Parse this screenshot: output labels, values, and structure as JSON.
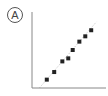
{
  "panel": {
    "label": "A"
  },
  "chart_data": {
    "type": "scatter",
    "title": "",
    "xlabel": "",
    "ylabel": "",
    "grid": false,
    "legend": null,
    "trendline": {
      "style": "dotted",
      "color": "#cccccc",
      "from": [
        0.1,
        0.0
      ],
      "to": [
        0.87,
        0.87
      ]
    },
    "xlim": [
      0,
      1
    ],
    "ylim": [
      0,
      1
    ],
    "x": [
      0.2,
      0.3,
      0.41,
      0.49,
      0.55,
      0.64,
      0.72,
      0.8
    ],
    "y": [
      0.11,
      0.21,
      0.35,
      0.39,
      0.5,
      0.61,
      0.68,
      0.76
    ],
    "marker": {
      "shape": "square",
      "color": "#222222",
      "size": 4
    },
    "axis_color": "#888888"
  }
}
